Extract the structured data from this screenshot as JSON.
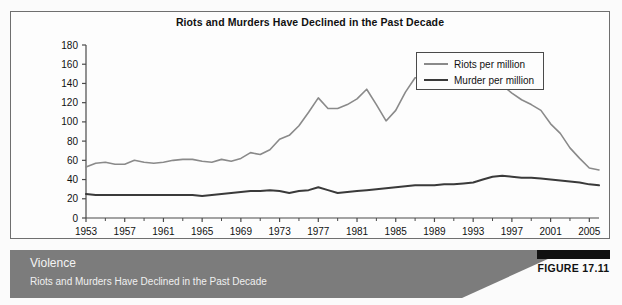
{
  "chart_panel": {
    "title": "Riots and Murders Have Declined in the Past Decade"
  },
  "legend": {
    "position": "top-right",
    "entries": [
      {
        "label": "Riots per million",
        "color": "#8a8a8a"
      },
      {
        "label": "Murder per million",
        "color": "#3a3a3a"
      }
    ]
  },
  "caption": {
    "title": "Violence",
    "subtitle": "Riots and Murders Have Declined in the Past Decade",
    "figure_label": "FIGURE 17.11",
    "bar_color": "#7c7c7c",
    "badge_bar_color": "#111111"
  },
  "axes": {
    "y_ticks": [
      "0",
      "20",
      "40",
      "60",
      "80",
      "100",
      "120",
      "140",
      "160",
      "180"
    ],
    "x_ticks": [
      "1953",
      "1957",
      "1961",
      "1965",
      "1969",
      "1973",
      "1977",
      "1981",
      "1985",
      "1989",
      "1993",
      "1997",
      "2001",
      "2005"
    ]
  },
  "chart_data": {
    "type": "line",
    "title": "Riots and Murders Have Declined in the Past Decade",
    "xlabel": "",
    "ylabel": "",
    "xlim": [
      1953,
      2006
    ],
    "ylim": [
      0,
      180
    ],
    "grid": false,
    "legend_position": "top-right",
    "x": [
      1953,
      1954,
      1955,
      1956,
      1957,
      1958,
      1959,
      1960,
      1961,
      1962,
      1963,
      1964,
      1965,
      1966,
      1967,
      1968,
      1969,
      1970,
      1971,
      1972,
      1973,
      1974,
      1975,
      1976,
      1977,
      1978,
      1979,
      1980,
      1981,
      1982,
      1983,
      1984,
      1985,
      1986,
      1987,
      1988,
      1989,
      1990,
      1991,
      1992,
      1993,
      1994,
      1995,
      1996,
      1997,
      1998,
      1999,
      2000,
      2001,
      2002,
      2003,
      2004,
      2005,
      2006
    ],
    "series": [
      {
        "name": "Riots per million",
        "color": "#8a8a8a",
        "values": [
          53,
          57,
          58,
          56,
          56,
          60,
          58,
          57,
          58,
          60,
          61,
          61,
          59,
          58,
          61,
          59,
          62,
          68,
          66,
          71,
          82,
          86,
          96,
          110,
          125,
          114,
          114,
          118,
          124,
          134,
          118,
          101,
          112,
          131,
          146,
          146,
          149,
          152,
          157,
          155,
          151,
          149,
          144,
          138,
          130,
          123,
          118,
          112,
          98,
          88,
          73,
          62,
          52,
          50
        ]
      },
      {
        "name": "Murder per million",
        "color": "#3a3a3a",
        "values": [
          25,
          24,
          24,
          24,
          24,
          24,
          24,
          24,
          24,
          24,
          24,
          24,
          23,
          24,
          25,
          26,
          27,
          28,
          28,
          29,
          28,
          26,
          28,
          29,
          32,
          29,
          26,
          27,
          28,
          29,
          30,
          31,
          32,
          33,
          34,
          34,
          34,
          35,
          35,
          36,
          37,
          40,
          43,
          44,
          43,
          42,
          42,
          41,
          40,
          39,
          38,
          37,
          35,
          34
        ]
      }
    ],
    "series_late_tail": {
      "riots_end_value": 52,
      "murder_end_value": 28
    }
  }
}
